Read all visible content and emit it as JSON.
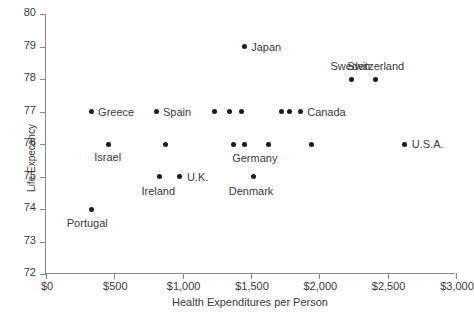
{
  "chart_data": {
    "type": "scatter",
    "title": "",
    "xlabel": "Health Expenditures  per Person",
    "ylabel": "Life Expecancy",
    "xlim": [
      0,
      3000
    ],
    "ylim": [
      72,
      80
    ],
    "grid": false,
    "legend": "none",
    "xticks": [
      {
        "value": 0,
        "label": "$0"
      },
      {
        "value": 500,
        "label": "$500"
      },
      {
        "value": 1000,
        "label": "$1,000"
      },
      {
        "value": 1500,
        "label": "$1,500"
      },
      {
        "value": 2000,
        "label": "$2,000"
      },
      {
        "value": 2500,
        "label": "$2,500"
      },
      {
        "value": 3000,
        "label": "$3,000"
      }
    ],
    "yticks": [
      {
        "value": 72,
        "label": "72"
      },
      {
        "value": 73,
        "label": "73"
      },
      {
        "value": 74,
        "label": "74"
      },
      {
        "value": 75,
        "label": "75"
      },
      {
        "value": 76,
        "label": "76"
      },
      {
        "value": 77,
        "label": "77"
      },
      {
        "value": 78,
        "label": "78"
      },
      {
        "value": 79,
        "label": "79"
      },
      {
        "value": 80,
        "label": "80"
      }
    ],
    "points": [
      {
        "x": 330,
        "y": 77,
        "label": "Greece",
        "label_dx": 7,
        "label_dy": -6
      },
      {
        "x": 805,
        "y": 77,
        "label": "Spain",
        "label_dx": 7,
        "label_dy": -6
      },
      {
        "x": 1230,
        "y": 77,
        "label": "",
        "label_dx": 0,
        "label_dy": 0
      },
      {
        "x": 1340,
        "y": 77,
        "label": "",
        "label_dx": 0,
        "label_dy": 0
      },
      {
        "x": 1430,
        "y": 77,
        "label": "",
        "label_dx": 0,
        "label_dy": 0
      },
      {
        "x": 1720,
        "y": 77,
        "label": "",
        "label_dx": 0,
        "label_dy": 0
      },
      {
        "x": 1780,
        "y": 77,
        "label": "",
        "label_dx": 0,
        "label_dy": 0
      },
      {
        "x": 1860,
        "y": 77,
        "label": "Canada",
        "label_dx": 7,
        "label_dy": -6
      },
      {
        "x": 1450,
        "y": 79,
        "label": "Japan",
        "label_dx": 7,
        "label_dy": -6
      },
      {
        "x": 2235,
        "y": 78,
        "label": "Sweden",
        "label_dx": -21,
        "label_dy": -19
      },
      {
        "x": 2410,
        "y": 78,
        "label": "Switzerland",
        "label_dx": -28,
        "label_dy": -19
      },
      {
        "x": 455,
        "y": 76,
        "label": "Israel",
        "label_dx": -14,
        "label_dy": 7
      },
      {
        "x": 875,
        "y": 76,
        "label": "",
        "label_dx": 0,
        "label_dy": 0
      },
      {
        "x": 1375,
        "y": 76,
        "label": "",
        "label_dx": 0,
        "label_dy": 0
      },
      {
        "x": 1450,
        "y": 76,
        "label": "Germany",
        "label_dx": -12,
        "label_dy": 8
      },
      {
        "x": 1625,
        "y": 76,
        "label": "",
        "label_dx": 0,
        "label_dy": 0
      },
      {
        "x": 1945,
        "y": 76,
        "label": "",
        "label_dx": 0,
        "label_dy": 0
      },
      {
        "x": 2625,
        "y": 76,
        "label": "U.S.A.",
        "label_dx": 7,
        "label_dy": -6
      },
      {
        "x": 830,
        "y": 75,
        "label": "Ireland",
        "label_dx": -18,
        "label_dy": 8
      },
      {
        "x": 980,
        "y": 75,
        "label": "U.K.",
        "label_dx": 7,
        "label_dy": -6
      },
      {
        "x": 1520,
        "y": 75,
        "label": "Denmark",
        "label_dx": -25,
        "label_dy": 8
      },
      {
        "x": 335,
        "y": 74,
        "label": "Portugal",
        "label_dx": -25,
        "label_dy": 8
      }
    ]
  }
}
